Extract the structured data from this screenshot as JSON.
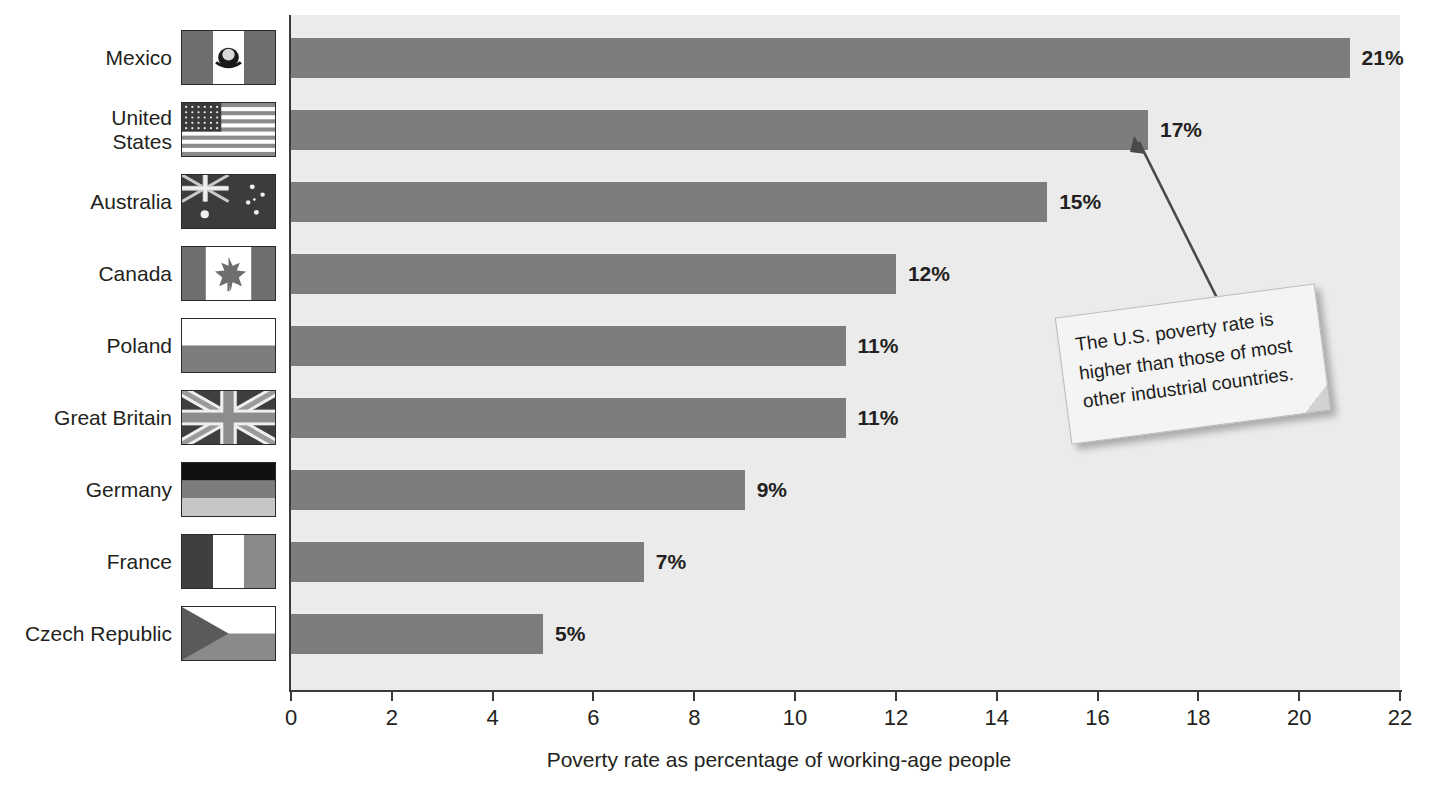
{
  "chart_data": {
    "type": "bar",
    "orientation": "horizontal",
    "title": "",
    "xlabel": "Poverty rate as percentage of working-age people",
    "ylabel": "",
    "xlim": [
      0,
      22
    ],
    "xticks": [
      0,
      2,
      4,
      6,
      8,
      10,
      12,
      14,
      16,
      18,
      20,
      22
    ],
    "grid": false,
    "legend": "none",
    "bar_color": "#7d7d7d",
    "plot_background": "#ebebeb",
    "categories": [
      "Mexico",
      "United States",
      "Australia",
      "Canada",
      "Poland",
      "Great Britain",
      "Germany",
      "France",
      "Czech Republic"
    ],
    "values": [
      21,
      17,
      15,
      12,
      11,
      11,
      9,
      7,
      5
    ],
    "value_labels": [
      "21%",
      "17%",
      "15%",
      "12%",
      "11%",
      "11%",
      "9%",
      "7%",
      "5%"
    ],
    "annotations": [
      {
        "text": "The U.S. poverty rate is higher than those of most other industrial countries.",
        "points_to": "United States"
      }
    ]
  },
  "axis": {
    "tick_labels": [
      "0",
      "2",
      "4",
      "6",
      "8",
      "10",
      "12",
      "14",
      "16",
      "18",
      "20",
      "22"
    ],
    "title": "Poverty rate as percentage of working-age people"
  },
  "rows": [
    {
      "label": "Mexico",
      "value_label": "21%",
      "value": 21,
      "flag": "flag-mexico"
    },
    {
      "label": "United\nStates",
      "value_label": "17%",
      "value": 17,
      "flag": "flag-united-states"
    },
    {
      "label": "Australia",
      "value_label": "15%",
      "value": 15,
      "flag": "flag-australia"
    },
    {
      "label": "Canada",
      "value_label": "12%",
      "value": 12,
      "flag": "flag-canada"
    },
    {
      "label": "Poland",
      "value_label": "11%",
      "value": 11,
      "flag": "flag-poland"
    },
    {
      "label": "Great Britain",
      "value_label": "11%",
      "value": 11,
      "flag": "flag-great-britain"
    },
    {
      "label": "Germany",
      "value_label": "9%",
      "value": 9,
      "flag": "flag-germany"
    },
    {
      "label": "France",
      "value_label": "7%",
      "value": 7,
      "flag": "flag-france"
    },
    {
      "label": "Czech Republic",
      "value_label": "5%",
      "value": 5,
      "flag": "flag-czech-republic"
    }
  ],
  "callout": {
    "line1": "The U.S. poverty rate is",
    "line2": "higher than those of most",
    "line3": "other industrial countries."
  }
}
